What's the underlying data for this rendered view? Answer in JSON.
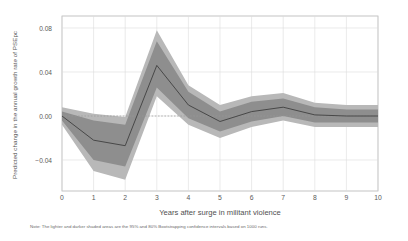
{
  "chart_data": {
    "type": "line",
    "title": "",
    "xlabel": "Years after surge in militant violence",
    "ylabel": "Predicted change in the annual growth rate of PSEpc",
    "note": "Note: The lighter and darker shaded areas are the 95% and 80% Bootstrapping confidence intervals based on 1000 runs.",
    "x": [
      0,
      1,
      2,
      3,
      4,
      5,
      6,
      7,
      8,
      9,
      10
    ],
    "xticklabels": [
      "0",
      "1",
      "2",
      "3",
      "4",
      "5",
      "6",
      "7",
      "8",
      "9",
      "10"
    ],
    "yticks": [
      -0.04,
      0.0,
      0.04,
      0.08
    ],
    "yticklabels": [
      "−0.04",
      "0.00",
      "0.04",
      "0.08"
    ],
    "xlim": [
      0,
      10
    ],
    "ylim": [
      -0.063,
      0.085
    ],
    "grid": true,
    "legend": "none",
    "zero_line": 0.0,
    "series": [
      {
        "name": "Predicted change (point estimate)",
        "kind": "line",
        "color": "#3f3f3f",
        "values": [
          0.0,
          -0.022,
          -0.027,
          0.046,
          0.01,
          -0.005,
          0.004,
          0.008,
          0.001,
          0.0,
          0.0
        ]
      },
      {
        "name": "80% Bootstrapping confidence interval",
        "kind": "band",
        "color": "#8e8e8e",
        "lower": [
          -0.004,
          -0.04,
          -0.046,
          0.026,
          -0.002,
          -0.014,
          -0.005,
          0.0,
          -0.006,
          -0.006,
          -0.006
        ],
        "upper": [
          0.004,
          -0.004,
          -0.008,
          0.068,
          0.022,
          0.004,
          0.013,
          0.016,
          0.008,
          0.006,
          0.006
        ]
      },
      {
        "name": "95% Bootstrapping confidence interval",
        "kind": "band",
        "color": "#b8b8b8",
        "lower": [
          -0.008,
          -0.05,
          -0.058,
          0.018,
          -0.008,
          -0.02,
          -0.01,
          -0.004,
          -0.01,
          -0.01,
          -0.01
        ],
        "upper": [
          0.008,
          0.002,
          -0.001,
          0.078,
          0.028,
          0.01,
          0.018,
          0.021,
          0.012,
          0.01,
          0.01
        ]
      }
    ],
    "colors": {
      "line": "#3f3f3f",
      "band_80": "#8e8e8e",
      "band_95": "#b8b8b8",
      "grid": "#dcdcdc",
      "axis": "#b0b0b0",
      "background": "#ffffff",
      "text": "#555555"
    }
  }
}
